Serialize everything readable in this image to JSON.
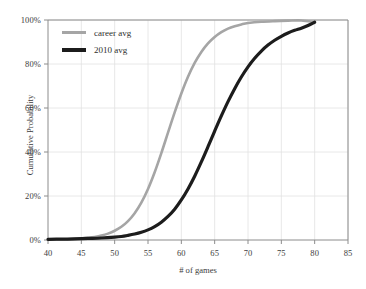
{
  "chart_data": {
    "type": "line",
    "title": "",
    "xlabel": "# of games",
    "ylabel": "Cumulative Probability",
    "xlim": [
      40,
      85
    ],
    "ylim": [
      0,
      100
    ],
    "xticks": [
      40,
      45,
      50,
      55,
      60,
      65,
      70,
      75,
      80,
      85
    ],
    "yticks": [
      0,
      20,
      40,
      60,
      80,
      100
    ],
    "xtick_labels": [
      "40",
      "45",
      "50",
      "55",
      "60",
      "65",
      "70",
      "75",
      "80",
      "85"
    ],
    "ytick_labels": [
      "0%",
      "20%",
      "40%",
      "60%",
      "80%",
      "100%"
    ],
    "grid": true,
    "legend_position": "top-left",
    "series": [
      {
        "name": "career avg",
        "color": "#a5a5a5",
        "line_width": 2.6,
        "x": [
          40,
          42,
          44,
          45,
          46,
          47,
          48,
          49,
          50,
          51,
          52,
          53,
          54,
          55,
          56,
          57,
          58,
          59,
          60,
          61,
          62,
          63,
          64,
          65,
          66,
          67,
          68,
          69,
          70,
          72,
          74,
          76,
          78,
          80
        ],
        "values": [
          0.2,
          0.3,
          0.5,
          0.7,
          1.0,
          1.4,
          2.0,
          2.9,
          4.2,
          6.0,
          8.6,
          12.2,
          17.0,
          23.2,
          30.8,
          39.5,
          48.8,
          58.0,
          66.6,
          74.2,
          80.5,
          85.5,
          89.4,
          92.3,
          94.5,
          96.1,
          97.2,
          98.0,
          98.6,
          99.2,
          99.5,
          99.7,
          99.8,
          99.0
        ]
      },
      {
        "name": "2010 avg",
        "color": "#1c1c1c",
        "line_width": 3.2,
        "x": [
          40,
          42,
          44,
          46,
          48,
          50,
          51,
          52,
          53,
          54,
          55,
          56,
          57,
          58,
          59,
          60,
          61,
          62,
          63,
          64,
          65,
          66,
          67,
          68,
          69,
          70,
          71,
          72,
          73,
          74,
          75,
          76,
          77,
          78,
          79,
          80
        ],
        "values": [
          0.3,
          0.4,
          0.5,
          0.7,
          0.9,
          1.3,
          1.6,
          2.1,
          2.7,
          3.5,
          4.6,
          6.1,
          8.1,
          10.7,
          14.0,
          18.2,
          23.2,
          29.0,
          35.5,
          42.4,
          49.5,
          56.4,
          62.9,
          68.8,
          74.1,
          78.7,
          82.6,
          85.9,
          88.6,
          90.8,
          92.6,
          94.1,
          95.3,
          96.3,
          97.5,
          99.0
        ]
      }
    ],
    "annotations": []
  },
  "axes": {
    "spine_color": "#8c8c8c",
    "grid_color": "#e2e2e2",
    "background": "#ffffff"
  },
  "legend": {
    "entries": [
      {
        "label": "career avg",
        "style": "thin"
      },
      {
        "label": "2010 avg",
        "style": "thick"
      }
    ]
  }
}
